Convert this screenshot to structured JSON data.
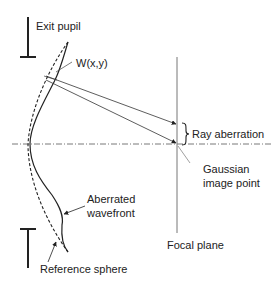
{
  "diagram": {
    "labels": {
      "exit_pupil": "Exit pupil",
      "wavefront_function": "W(x,y)",
      "ray_aberration": "Ray aberration",
      "gaussian_image_point_line1": "Gaussian",
      "gaussian_image_point_line2": "image point",
      "aberrated_wavefront_line1": "Aberrated",
      "aberrated_wavefront_line2": "wavefront",
      "focal_plane": "Focal plane",
      "reference_sphere": "Reference sphere"
    },
    "colors": {
      "line": "#222222",
      "axis": "#555555",
      "focal_plane": "#777777",
      "background": "#ffffff"
    }
  }
}
